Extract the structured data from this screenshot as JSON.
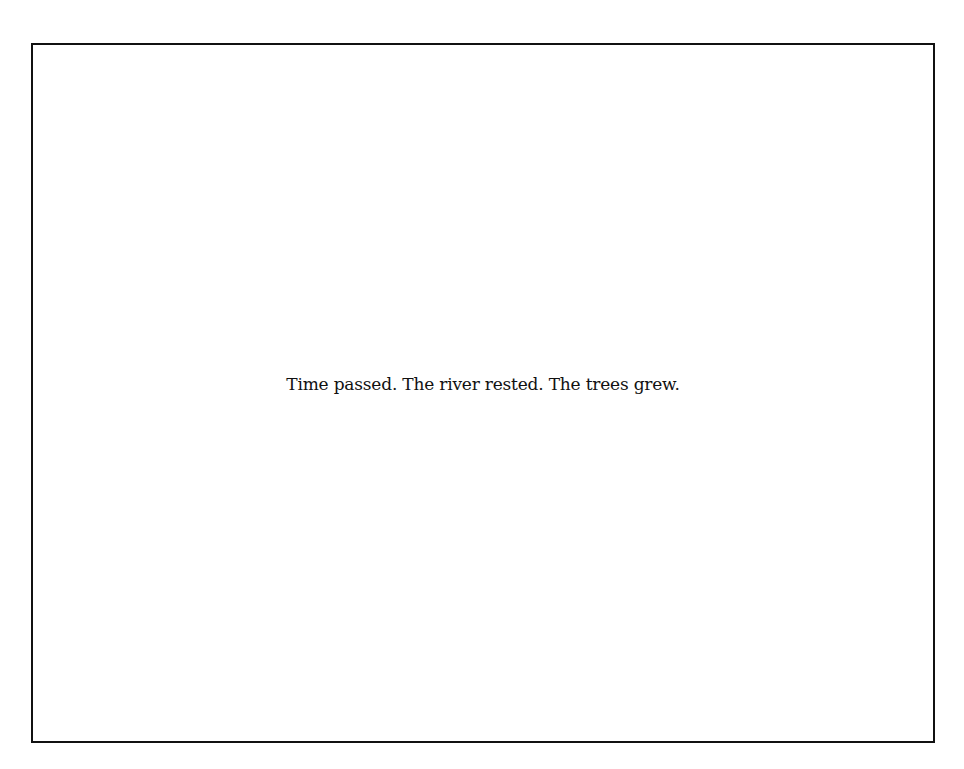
{
  "frame": {
    "border_color": "#111111",
    "background_color": "#ffffff"
  },
  "caption": {
    "text": "Time passed. The river rested. The trees grew."
  }
}
